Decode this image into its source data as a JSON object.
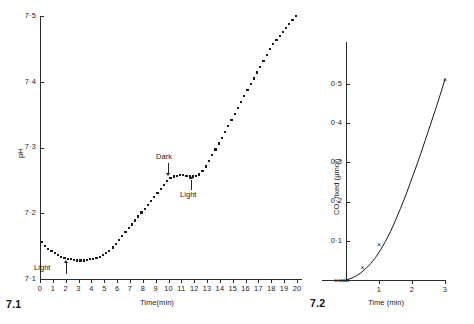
{
  "figure": {
    "panels": [
      {
        "id": "7.1",
        "number_label": "7.1",
        "xlabel": "Time(min)",
        "ylabel": "pH",
        "y_ticks": [
          "7.1",
          "7.2",
          "7.3",
          "7.4",
          "7.5"
        ],
        "x_ticks": [
          "0",
          "1",
          "2",
          "3",
          "4",
          "5",
          "6",
          "7",
          "8",
          "9",
          "10",
          "11",
          "12",
          "13",
          "14",
          "15",
          "16",
          "17",
          "18",
          "19",
          "20"
        ],
        "annotations": [
          {
            "label": "Light",
            "arrow": "up",
            "at_minute": 2
          },
          {
            "label": "Dark",
            "arrow": "down",
            "at_minute": 10
          },
          {
            "label": "Light",
            "arrow": "up",
            "at_minute": 12
          }
        ]
      },
      {
        "id": "7.2",
        "number_label": "7.2",
        "xlabel": "Time  (min)",
        "ylabel": "CO₂ fixed  (μmol)",
        "y_ticks": [
          "0.1",
          "0.2",
          "0.3",
          "0.4",
          "0.5"
        ],
        "x_ticks": [
          "1",
          "2",
          "3"
        ]
      }
    ]
  },
  "chart_data": [
    {
      "type": "scatter",
      "id": "7.1",
      "title": "",
      "xlabel": "Time(min)",
      "ylabel": "pH",
      "xlim": [
        0,
        20.6
      ],
      "ylim": [
        7.1,
        7.5
      ],
      "grid": false,
      "legend": null,
      "marker": "filled-square",
      "annotations": [
        {
          "text": "Light",
          "x": 2,
          "y": 7.118,
          "arrow": "up"
        },
        {
          "text": "Dark",
          "x": 10,
          "y": 7.284,
          "arrow": "down"
        },
        {
          "text": "Light",
          "x": 12.1,
          "y": 7.232,
          "arrow": "up"
        }
      ],
      "x": [
        0.15,
        0.4,
        0.65,
        0.9,
        1.15,
        1.4,
        1.65,
        1.9,
        2.15,
        2.4,
        2.65,
        2.9,
        3.15,
        3.4,
        3.65,
        3.9,
        4.15,
        4.4,
        4.65,
        4.9,
        5.15,
        5.4,
        5.65,
        5.9,
        6.15,
        6.4,
        6.65,
        6.9,
        7.15,
        7.4,
        7.65,
        7.9,
        8.15,
        8.4,
        8.65,
        8.9,
        9.15,
        9.4,
        9.65,
        9.9,
        10.15,
        10.4,
        10.65,
        10.9,
        11.15,
        11.4,
        11.65,
        11.9,
        12.15,
        12.4,
        12.65,
        12.9,
        13.15,
        13.4,
        13.65,
        13.9,
        14.15,
        14.4,
        14.65,
        14.9,
        15.15,
        15.4,
        15.65,
        15.9,
        16.15,
        16.4,
        16.65,
        16.9,
        17.15,
        17.4,
        17.65,
        17.9,
        18.15,
        18.4,
        18.65,
        18.9,
        19.15,
        19.4,
        19.65,
        19.9
      ],
      "y": [
        7.156,
        7.15,
        7.146,
        7.142,
        7.139,
        7.136,
        7.134,
        7.132,
        7.131,
        7.13,
        7.129,
        7.128,
        7.128,
        7.128,
        7.129,
        7.13,
        7.131,
        7.132,
        7.134,
        7.136,
        7.139,
        7.143,
        7.148,
        7.153,
        7.159,
        7.165,
        7.171,
        7.177,
        7.183,
        7.189,
        7.195,
        7.201,
        7.207,
        7.213,
        7.219,
        7.225,
        7.231,
        7.237,
        7.243,
        7.249,
        7.254,
        7.256,
        7.257,
        7.258,
        7.258,
        7.257,
        7.256,
        7.256,
        7.257,
        7.259,
        7.264,
        7.271,
        7.279,
        7.288,
        7.297,
        7.306,
        7.315,
        7.324,
        7.333,
        7.342,
        7.351,
        7.36,
        7.369,
        7.378,
        7.387,
        7.396,
        7.405,
        7.414,
        7.423,
        7.432,
        7.441,
        7.45,
        7.458,
        7.464,
        7.47,
        7.476,
        7.482,
        7.488,
        7.494,
        7.5
      ]
    },
    {
      "type": "line",
      "id": "7.2",
      "title": "",
      "xlabel": "Time  (min)",
      "ylabel": "CO₂ fixed  (μmol)",
      "xlim": [
        -0.35,
        3.15
      ],
      "ylim": [
        0,
        0.56
      ],
      "grid": false,
      "legend": null,
      "marker": "x",
      "line_x": [
        0.0,
        0.15,
        0.3,
        0.45,
        0.6,
        0.75,
        0.9,
        1.05,
        1.2,
        1.35,
        1.5,
        1.65,
        1.8,
        1.95,
        2.1,
        2.25,
        2.4,
        2.55,
        2.7,
        2.85,
        3.0
      ],
      "line_y": [
        0.0,
        0.004,
        0.01,
        0.018,
        0.029,
        0.042,
        0.058,
        0.077,
        0.099,
        0.124,
        0.152,
        0.182,
        0.214,
        0.248,
        0.283,
        0.319,
        0.356,
        0.394,
        0.432,
        0.471,
        0.512
      ],
      "points_x": [
        -0.3,
        -0.18,
        -0.1,
        -0.03,
        0.05,
        0.5,
        1.0,
        3.0
      ],
      "points_y": [
        0.0,
        0.0,
        0.0,
        0.0,
        0.0,
        0.034,
        0.091,
        0.512
      ]
    }
  ]
}
